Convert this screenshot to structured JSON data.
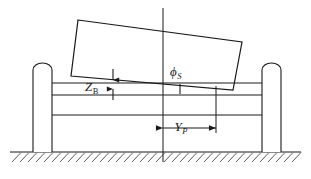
{
  "figure": {
    "kind": "engineering-schematic",
    "background_color": "#ffffff",
    "line_color": "#1a1a1a",
    "ground_hatch_color": "#4a4a4a"
  },
  "labels": {
    "heave": {
      "symbol": "Z",
      "subscript": "B",
      "text": "ZB",
      "meaning": "vertical offset of body reference from deck"
    },
    "roll_angle": {
      "symbol": "ϕ",
      "subscript": "S",
      "text": "ϕS",
      "meaning": "tilt angle of the body relative to horizontal"
    },
    "lateral_offset": {
      "symbol": "Y",
      "subscript": "P",
      "text": "YP",
      "meaning": "horizontal distance from centreline to reference station"
    }
  },
  "geometry": {
    "canvas": {
      "width": 311,
      "height": 179
    },
    "centerline": {
      "x": 163,
      "y_top": 8,
      "y_bottom": 162
    },
    "reference_line": {
      "x": 216,
      "y_top": 86,
      "y_bottom": 133
    },
    "tilted_body": {
      "corners": [
        {
          "x": 78,
          "y": 20
        },
        {
          "x": 242,
          "y": 42
        },
        {
          "x": 233,
          "y": 90
        },
        {
          "x": 71,
          "y": 76
        }
      ]
    },
    "deck_lines": [
      {
        "x1": 52,
        "x2": 262,
        "y": 95
      },
      {
        "x1": 52,
        "x2": 262,
        "y": 115
      },
      {
        "x1": 52,
        "x2": 262,
        "y": 83
      }
    ],
    "posts": [
      {
        "name": "left-post",
        "x": 33,
        "width": 19,
        "y_top": 62,
        "y_bottom": 152,
        "cap": "rounded"
      },
      {
        "name": "right-post",
        "x": 262,
        "width": 19,
        "y_top": 62,
        "y_bottom": 152,
        "cap": "rounded"
      }
    ],
    "ground": {
      "y": 152,
      "x1": 10,
      "x2": 301,
      "hatch": true
    },
    "zb_dimension": {
      "x": 113,
      "y_top": 74,
      "y_bottom": 95
    },
    "phi_tick": {
      "x": 180,
      "y_top": 84,
      "y_bottom": 94
    },
    "yp_dimension": {
      "y": 128,
      "x_left": 163,
      "x_right": 216
    }
  }
}
